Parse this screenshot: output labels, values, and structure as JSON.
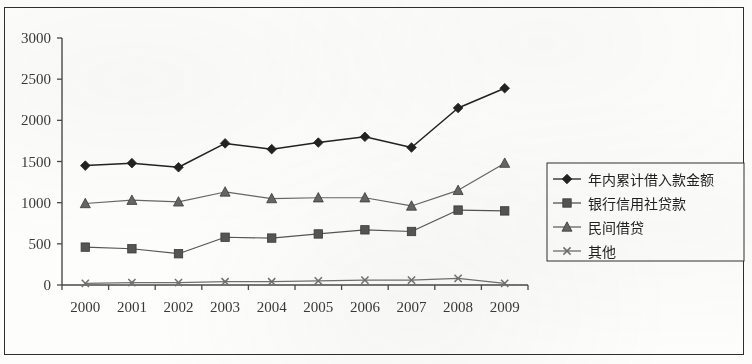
{
  "chart_data": {
    "type": "line",
    "title": "",
    "xlabel": "",
    "ylabel": "",
    "categories": [
      "2000",
      "2001",
      "2002",
      "2003",
      "2004",
      "2005",
      "2006",
      "2007",
      "2008",
      "2009"
    ],
    "ylim": [
      0,
      3000
    ],
    "ytick_labels": [
      "3000",
      "2500",
      "2000",
      "1500",
      "1000",
      "500",
      "0"
    ],
    "ytick_values": [
      3000,
      2500,
      2000,
      1500,
      1000,
      500,
      0
    ],
    "grid": false,
    "legend_position": "right",
    "series": [
      {
        "name": "年内累计借入款金额",
        "marker": "diamond",
        "color": "#222222",
        "values": [
          1450,
          1480,
          1430,
          1720,
          1650,
          1730,
          1800,
          1670,
          2150,
          2390
        ]
      },
      {
        "name": "银行信用社贷款",
        "marker": "square",
        "color": "#555555",
        "values": [
          460,
          440,
          380,
          580,
          570,
          620,
          670,
          650,
          910,
          900
        ]
      },
      {
        "name": "民间借贷",
        "marker": "triangle",
        "color": "#666666",
        "values": [
          990,
          1030,
          1010,
          1130,
          1050,
          1060,
          1060,
          960,
          1150,
          1480
        ]
      },
      {
        "name": "其他",
        "marker": "x",
        "color": "#707070",
        "values": [
          20,
          30,
          30,
          40,
          40,
          50,
          60,
          60,
          80,
          20
        ]
      }
    ]
  },
  "legend": {
    "entries": [
      {
        "label": "年内累计借入款金额",
        "marker": "diamond"
      },
      {
        "label": "银行信用社贷款",
        "marker": "square"
      },
      {
        "label": "民间借贷",
        "marker": "triangle"
      },
      {
        "label": "其他",
        "marker": "x"
      }
    ]
  },
  "colors": {
    "axis": "#4a4a4a",
    "page_border": "#2e2e2e",
    "background": "#fdfdfc"
  }
}
